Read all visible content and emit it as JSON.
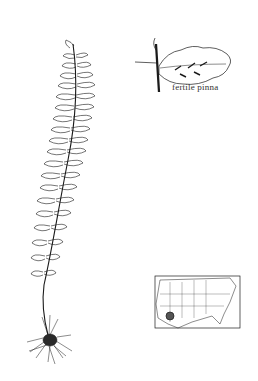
{
  "illustration": {
    "subject": "fern botanical illustration",
    "inset_label": "fertile pinna",
    "components": [
      "whole-frond-with-roots",
      "fertile-pinna-detail",
      "range-map"
    ],
    "colors": {
      "ink": "#1a1a1a",
      "background": "#ffffff",
      "range_mark": "#555555"
    }
  }
}
